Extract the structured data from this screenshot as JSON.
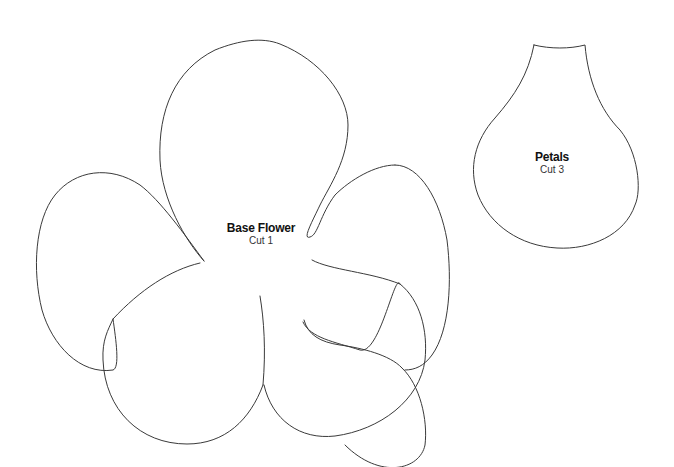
{
  "shapes": {
    "base_flower": {
      "name": "Base Flower",
      "instruction": "Cut 1"
    },
    "petals": {
      "name": "Petals",
      "instruction": "Cut 3"
    }
  },
  "colors": {
    "background": "#ffffff",
    "outline": "#3a3a3a",
    "text": "#111111"
  }
}
